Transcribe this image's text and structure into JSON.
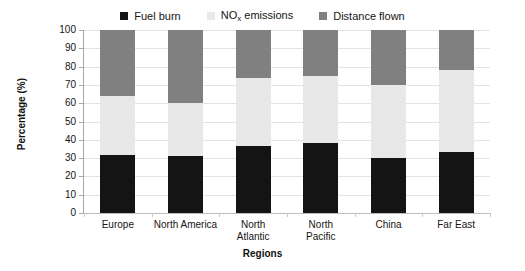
{
  "chart_data": {
    "type": "bar",
    "subtype": "stacked-100",
    "title": "",
    "xlabel": "Regions",
    "ylabel": "Percentage (%)",
    "ylim": [
      0,
      100
    ],
    "yticks": [
      0,
      10,
      20,
      30,
      40,
      50,
      60,
      70,
      80,
      90,
      100
    ],
    "ytick_labels": [
      "0",
      "10",
      "20",
      "30",
      "40",
      "50",
      "60",
      "70",
      "80",
      "90",
      "100"
    ],
    "grid": true,
    "legend_position": "top-center",
    "categories": [
      "Europe",
      "North America",
      "North Atlantic",
      "North Pacific",
      "China",
      "Far East"
    ],
    "category_lines": [
      [
        "Europe"
      ],
      [
        "North America"
      ],
      [
        "North",
        "Atlantic"
      ],
      [
        "North",
        "Pacific"
      ],
      [
        "China"
      ],
      [
        "Far East"
      ]
    ],
    "series": [
      {
        "name": "Fuel burn",
        "color": "#141414",
        "values": [
          31.5,
          31.0,
          36.5,
          38.0,
          30.0,
          33.5
        ]
      },
      {
        "name": "NO<sub>x</sub> emissions",
        "name_plain": "NOx emissions",
        "color": "#e8e8e8",
        "values": [
          32.5,
          29.0,
          37.5,
          37.0,
          40.0,
          44.5
        ]
      },
      {
        "name": "Distance flown",
        "color": "#808080",
        "values": [
          36.0,
          40.0,
          26.0,
          25.0,
          30.0,
          22.0
        ]
      }
    ],
    "cumulative_tops": [
      [
        31.5,
        64.0,
        100.0
      ],
      [
        31.0,
        60.0,
        100.0
      ],
      [
        36.5,
        74.0,
        100.0
      ],
      [
        38.0,
        75.0,
        100.0
      ],
      [
        30.0,
        70.0,
        100.0
      ],
      [
        33.5,
        78.0,
        100.0
      ]
    ]
  },
  "legend": {
    "entries": [
      {
        "label": "Fuel burn",
        "html": "Fuel burn",
        "color": "#141414"
      },
      {
        "label": "NOx emissions",
        "html": "NO<sub>x</sub> emissions",
        "color": "#e8e8e8"
      },
      {
        "label": "Distance flown",
        "html": "Distance flown",
        "color": "#808080"
      }
    ]
  },
  "axes": {
    "y_title": "Percentage (%)",
    "x_title": "Regions"
  }
}
